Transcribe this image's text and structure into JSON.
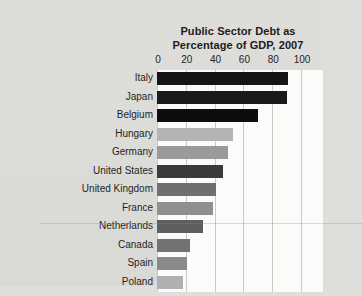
{
  "chart_data": {
    "type": "bar",
    "orientation": "horizontal",
    "title": "Public Sector Debt as Percentage of GDP, 2007",
    "title_lines": [
      "Public Sector Debt as",
      "Percentage of GDP, 2007"
    ],
    "xlabel": "",
    "ylabel": "",
    "xlim": [
      0,
      100
    ],
    "grid": true,
    "grid_axis": "x",
    "legend": false,
    "xticks": [
      0,
      20,
      40,
      60,
      80,
      100
    ],
    "xtick_labels": [
      "0",
      "20",
      "40",
      "60",
      "80",
      "100"
    ],
    "categories": [
      "Italy",
      "Japan",
      "Belgium",
      "Hungary",
      "Germany",
      "United States",
      "United Kingdom",
      "France",
      "Netherlands",
      "Canada",
      "Spain",
      "Poland"
    ],
    "values": [
      91,
      90,
      70,
      53,
      49,
      46,
      41,
      39,
      32,
      23,
      21,
      18
    ],
    "bar_colors": [
      "#151515",
      "#1a1a1a",
      "#0d0d0d",
      "#b4b4b4",
      "#9a9a9a",
      "#3a3a3a",
      "#6f6f6f",
      "#8f8f8f",
      "#5e5e5e",
      "#727272",
      "#8a8a8a",
      "#b0b0b0"
    ]
  },
  "style": {
    "page_background": "#dededa",
    "plot_background": "#fbfbfa",
    "gridline_color": "#c9c9c5",
    "text_color": "#1c1c1c"
  }
}
